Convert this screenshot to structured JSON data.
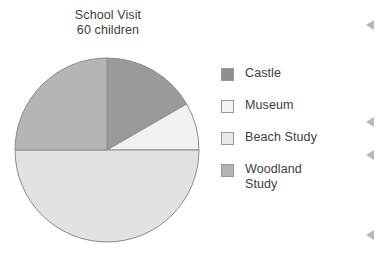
{
  "chart_data": {
    "type": "pie",
    "title": "School Visit\n60 children",
    "title_lines": [
      "School Visit",
      "60 children"
    ],
    "total": 60,
    "total_label": "60 children",
    "categories": [
      "Castle",
      "Museum",
      "Beach Study",
      "Woodland Study"
    ],
    "values": [
      10,
      5,
      15,
      30
    ],
    "percentages": [
      16.7,
      8.3,
      25,
      50
    ],
    "angles_deg": [
      60,
      30,
      90,
      180
    ],
    "slices": [
      {
        "label": "Castle",
        "value": 10,
        "percent": 16.7,
        "start_deg": 0,
        "end_deg": 60,
        "color": "#9a9a9a"
      },
      {
        "label": "Museum",
        "value": 5,
        "percent": 8.3,
        "start_deg": 60,
        "end_deg": 90,
        "color": "#f1f1f1"
      },
      {
        "label": "Woodland Study",
        "value": 30,
        "percent": 50,
        "start_deg": 90,
        "end_deg": 270,
        "color": "#e2e2e2"
      },
      {
        "label": "Beach Study",
        "value": 15,
        "percent": 25,
        "start_deg": 270,
        "end_deg": 360,
        "color": "#b5b5b5"
      }
    ],
    "legend": {
      "position": "right",
      "entries": [
        {
          "label": "Castle",
          "label_line2": "",
          "swatch": "#8f8f8f"
        },
        {
          "label": "Museum",
          "label_line2": "",
          "swatch": "#f4f4f4"
        },
        {
          "label": "Beach Study",
          "label_line2": "",
          "swatch": "#e8e8e8"
        },
        {
          "label": "Woodland",
          "label_line2": "Study",
          "swatch": "#b4b4b4"
        }
      ]
    },
    "xlabel": "",
    "ylabel": "",
    "grid": false,
    "stroke_color": "#8c8c8c"
  },
  "edge_marks": [
    {
      "name": "edge-marker-1",
      "top": 20
    },
    {
      "name": "edge-marker-2",
      "top": 117
    },
    {
      "name": "edge-marker-3",
      "top": 150
    },
    {
      "name": "edge-marker-4",
      "top": 230
    }
  ]
}
